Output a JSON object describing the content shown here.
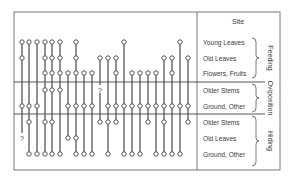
{
  "header": {
    "site_label": "Site"
  },
  "rows": [
    {
      "label": "Young Leaves",
      "y": 42,
      "group": "feeding"
    },
    {
      "label": "Old Leaves",
      "y": 58,
      "group": "feeding"
    },
    {
      "label": "Flowers, Fruits",
      "y": 73,
      "group": "feeding"
    },
    {
      "label": "Older Stems",
      "y": 90,
      "group": "oviposition"
    },
    {
      "label": "Ground, Other",
      "y": 106,
      "group": "oviposition"
    },
    {
      "label": "Older Stems",
      "y": 122,
      "group": "hiding"
    },
    {
      "label": "Old Leaves",
      "y": 138,
      "group": "hiding"
    },
    {
      "label": "Ground, Other",
      "y": 154,
      "group": "hiding"
    }
  ],
  "groups": [
    {
      "id": "feeding",
      "label": "Feeding",
      "y1": 38,
      "y2": 78
    },
    {
      "id": "oviposition",
      "label": "Oviposition",
      "y1": 84,
      "y2": 112
    },
    {
      "id": "hiding",
      "label": "Hiding",
      "y1": 116,
      "y2": 166
    }
  ],
  "columns": [
    {
      "x": 22,
      "points": [
        0,
        1,
        4
      ],
      "unknown": [
        6
      ]
    },
    {
      "x": 29,
      "points": [
        0,
        4,
        5,
        7
      ],
      "unknown": []
    },
    {
      "x": 37,
      "points": [
        0,
        4,
        7
      ],
      "unknown": []
    },
    {
      "x": 45,
      "points": [
        0,
        1,
        2,
        3,
        5,
        7
      ],
      "unknown": []
    },
    {
      "x": 52,
      "points": [
        0,
        1,
        2,
        3,
        5,
        7
      ],
      "unknown": []
    },
    {
      "x": 60,
      "points": [
        0,
        1,
        2,
        3,
        7
      ],
      "unknown": []
    },
    {
      "x": 68,
      "points": [
        2,
        4,
        6
      ],
      "unknown": []
    },
    {
      "x": 76,
      "points": [
        0,
        1,
        2,
        4,
        6,
        7
      ],
      "unknown": []
    },
    {
      "x": 84,
      "points": [
        2,
        4,
        7
      ],
      "unknown": []
    },
    {
      "x": 92,
      "points": [
        2,
        4,
        7
      ],
      "unknown": []
    },
    {
      "x": 100,
      "points": [
        1,
        5
      ],
      "unknown": [
        3
      ]
    },
    {
      "x": 108,
      "points": [
        1,
        4,
        5,
        7
      ],
      "unknown": []
    },
    {
      "x": 116,
      "points": [
        1,
        2,
        4,
        5
      ],
      "unknown": []
    },
    {
      "x": 124,
      "points": [
        0,
        4,
        7
      ],
      "unknown": []
    },
    {
      "x": 132,
      "points": [
        2,
        4,
        7
      ],
      "unknown": []
    },
    {
      "x": 140,
      "points": [
        2,
        4,
        7
      ],
      "unknown": []
    },
    {
      "x": 148,
      "points": [
        2,
        4,
        5
      ],
      "unknown": []
    },
    {
      "x": 156,
      "points": [
        2,
        4,
        7
      ],
      "unknown": []
    },
    {
      "x": 164,
      "points": [
        1,
        4,
        5,
        7
      ],
      "unknown": []
    },
    {
      "x": 172,
      "points": [
        1,
        2,
        4,
        7
      ],
      "unknown": []
    },
    {
      "x": 180,
      "points": [
        0,
        4,
        7
      ],
      "unknown": []
    },
    {
      "x": 188,
      "points": [
        1,
        4,
        5
      ],
      "unknown": []
    }
  ],
  "unknown_mark": "?",
  "colors": {
    "line": "#555555",
    "frame": "#777777",
    "marker_fill": "#ffffff"
  }
}
